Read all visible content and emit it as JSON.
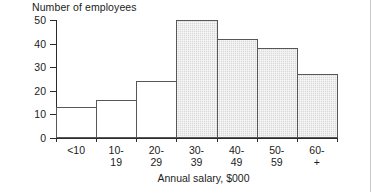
{
  "chart_data": {
    "type": "bar",
    "title": "",
    "ylabel": "Number of employees",
    "xlabel": "Annual salary, $000",
    "categories": [
      "<10",
      "10-19",
      "20-29",
      "30-39",
      "40-49",
      "50-59",
      "60-+"
    ],
    "category_lines": [
      [
        "<10",
        ""
      ],
      [
        "10-",
        "19"
      ],
      [
        "20-",
        "29"
      ],
      [
        "30-",
        "39"
      ],
      [
        "40-",
        "49"
      ],
      [
        "50-",
        "59"
      ],
      [
        "60-",
        "+"
      ]
    ],
    "values": [
      13,
      16,
      24,
      50,
      42,
      38,
      27
    ],
    "bar_styles": [
      "open",
      "open",
      "open",
      "shaded",
      "shaded",
      "shaded",
      "shaded"
    ],
    "ylim": [
      0,
      50
    ],
    "yticks": [
      0,
      10,
      20,
      30,
      40,
      50
    ],
    "ytick_labels": [
      "0",
      "10",
      "20",
      "30",
      "40",
      "50"
    ],
    "grid": false,
    "legend": "none",
    "colors": {
      "shaded_fill": "#d9d9d9",
      "bar_outline": "#55585a",
      "axis": "#2b2b2b",
      "text": "#1c1c1c",
      "background": "#ffffff"
    }
  }
}
